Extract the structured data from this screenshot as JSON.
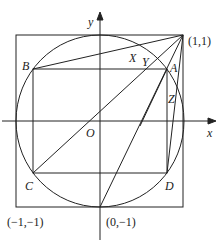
{
  "diagram": {
    "axes": {
      "x_label": "x",
      "y_label": "y",
      "origin_label": "O"
    },
    "points": {
      "A": "A",
      "B": "B",
      "C": "C",
      "D": "D",
      "X": "X",
      "Y": "Y",
      "Z": "Z"
    },
    "coordinates": {
      "top_right": "(1,1)",
      "bottom_left": "(−1,−1)",
      "bottom_center": "(0,−1)"
    },
    "colors": {
      "stroke": "#222222",
      "background": "#ffffff"
    }
  }
}
